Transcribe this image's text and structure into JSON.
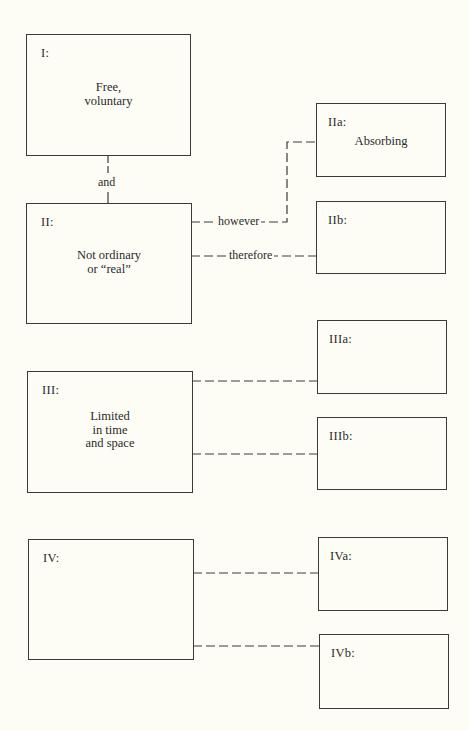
{
  "diagram": {
    "boxes": {
      "I": {
        "label": "I:",
        "text": "Free,\nvoluntary"
      },
      "II": {
        "label": "II:",
        "text": "Not ordinary\nor “real”"
      },
      "IIa": {
        "label": "IIa:",
        "text": "Absorbing"
      },
      "IIb": {
        "label": "IIb:",
        "text": ""
      },
      "III": {
        "label": "III:",
        "text": "Limited\nin time\nand space"
      },
      "IIIa": {
        "label": "IIIa:",
        "text": ""
      },
      "IIIb": {
        "label": "IIIb:",
        "text": ""
      },
      "IV": {
        "label": "IV:",
        "text": ""
      },
      "IVa": {
        "label": "IVa:",
        "text": ""
      },
      "IVb": {
        "label": "IVb:",
        "text": ""
      }
    },
    "connectors": {
      "I_II": {
        "label": "and"
      },
      "II_IIa": {
        "label": "however"
      },
      "II_IIb": {
        "label": "therefore"
      }
    },
    "colors": {
      "background": "#fdfdf6",
      "line": "#3a3a3a",
      "text": "#2a2a2a"
    }
  }
}
